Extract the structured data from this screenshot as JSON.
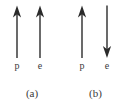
{
  "figure": {
    "background_color": "#ffffff",
    "stroke_color": "#2b2b2b",
    "text_color": "#3a3a3a",
    "panels": [
      {
        "id": "a",
        "caption": "(a)",
        "arrows": [
          {
            "name": "proton-spin-arrow",
            "label": "p",
            "direction": "up",
            "icon": "arrow-up-icon",
            "x": 17,
            "y_top": 6,
            "y_bottom": 57
          },
          {
            "name": "electron-spin-arrow",
            "label": "e",
            "direction": "up",
            "icon": "arrow-up-icon",
            "x": 40,
            "y_top": 6,
            "y_bottom": 57
          }
        ]
      },
      {
        "id": "b",
        "caption": "(b)",
        "arrows": [
          {
            "name": "proton-spin-arrow",
            "label": "p",
            "direction": "up",
            "icon": "arrow-up-icon",
            "x": 82,
            "y_top": 6,
            "y_bottom": 57
          },
          {
            "name": "electron-spin-arrow",
            "label": "e",
            "direction": "down",
            "icon": "arrow-down-icon",
            "x": 107,
            "y_top": 6,
            "y_bottom": 57
          }
        ]
      }
    ]
  }
}
